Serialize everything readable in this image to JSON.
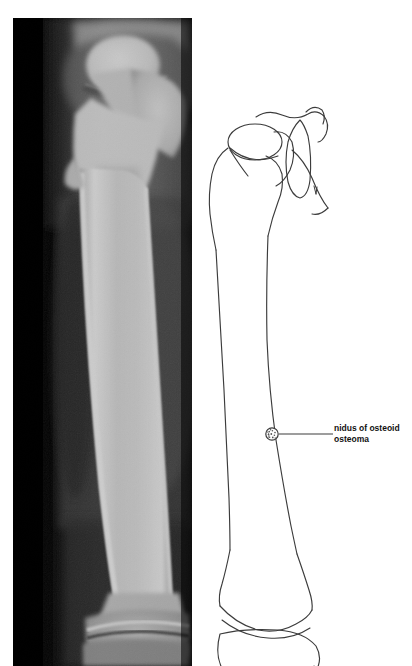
{
  "figure": {
    "kind": "radiograph-with-line-diagram",
    "background_color": "#ffffff",
    "ink_color": "#3a3a3a",
    "label_color": "#111111"
  },
  "radiograph": {
    "name": "femur-radiograph",
    "anatomy": "femur",
    "view": "anteroposterior",
    "film_background_color": "#050505",
    "bone_bright_color": "#f2f2f2",
    "soft_tissue_color": "#6a6a6a",
    "regions": [
      "femoral head",
      "femoral neck",
      "greater trochanter",
      "femoral shaft",
      "distal femur",
      "knee joint"
    ]
  },
  "diagram": {
    "name": "femur-line-diagram",
    "anatomy": "femur",
    "parts": [
      "femoral head",
      "femoral neck",
      "greater trochanter",
      "lesser trochanter",
      "acetabular rim",
      "femoral shaft",
      "distal femoral condyles",
      "patella"
    ]
  },
  "annotation": {
    "marker_name": "nidus-marker",
    "marker_style": "stippled circle",
    "marker_center": {
      "x": 272,
      "y": 434
    },
    "leader_line": {
      "x1": 279,
      "y1": 434,
      "x2": 332,
      "y2": 434
    },
    "label_lines": [
      "nidus of osteoid",
      "osteoma"
    ],
    "label_text": "nidus of osteoid osteoma"
  }
}
